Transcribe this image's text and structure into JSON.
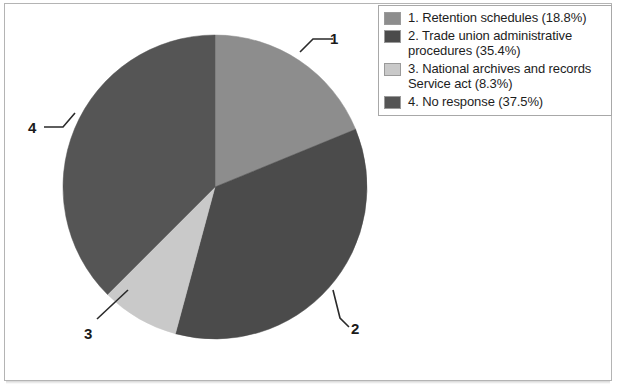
{
  "figure": {
    "background_color": "#ffffff",
    "frame_color": "#b4b4b4"
  },
  "chart_data": {
    "type": "pie",
    "title": "",
    "xlabel": "",
    "ylabel": "",
    "grid": false,
    "legend_position": "top-right",
    "start_angle_deg": 0,
    "direction": "clockwise",
    "center": {
      "x": 215,
      "y": 187
    },
    "radius": 152,
    "categories": [
      "Retention schedules",
      "Trade union administrative procedures",
      "National archives and records Service act",
      "No response"
    ],
    "values": [
      18.8,
      35.4,
      8.3,
      37.5
    ],
    "units": "percent",
    "colors": [
      "#8d8d8d",
      "#4b4b4b",
      "#c9c9c9",
      "#555555"
    ],
    "slices": [
      {
        "index": 1,
        "label": "Retention schedules",
        "percent": 18.8,
        "percent_text": "18.8%",
        "color": "#8d8d8d",
        "start_deg": 0.0,
        "end_deg": 67.7,
        "callout": "1"
      },
      {
        "index": 2,
        "label": "Trade union administrative procedures",
        "percent": 35.4,
        "percent_text": "35.4%",
        "color": "#4b4b4b",
        "start_deg": 67.7,
        "end_deg": 195.1,
        "callout": "2"
      },
      {
        "index": 3,
        "label": "National archives and records Service act",
        "percent": 8.3,
        "percent_text": "8.3%",
        "color": "#c9c9c9",
        "start_deg": 195.1,
        "end_deg": 225.0,
        "callout": "3"
      },
      {
        "index": 4,
        "label": "No response",
        "percent": 37.5,
        "percent_text": "37.5%",
        "color": "#555555",
        "start_deg": 225.0,
        "end_deg": 360.0,
        "callout": "4"
      }
    ]
  },
  "legend": {
    "border_color": "#a8a8a8",
    "items": [
      {
        "swatch_color": "#8d8d8d",
        "label": "1. Retention schedules (18.8%)"
      },
      {
        "swatch_color": "#4b4b4b",
        "label": "2. Trade union administrative procedures (35.4%)"
      },
      {
        "swatch_color": "#c9c9c9",
        "label": "3. National archives and records Service act  (8.3%)"
      },
      {
        "swatch_color": "#555555",
        "label": "4. No response (37.5%)"
      }
    ]
  },
  "callouts": [
    {
      "name": "callout-1",
      "text": "1"
    },
    {
      "name": "callout-2",
      "text": "2"
    },
    {
      "name": "callout-3",
      "text": "3"
    },
    {
      "name": "callout-4",
      "text": "4"
    }
  ]
}
